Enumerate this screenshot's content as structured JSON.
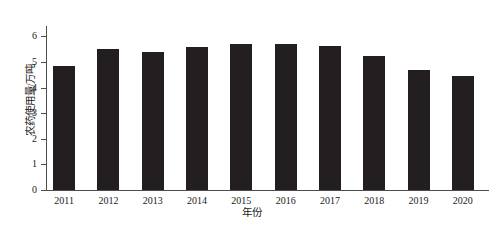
{
  "chart_data": {
    "type": "bar",
    "title": "",
    "xlabel": "年份",
    "ylabel": "农药使用量/万吨",
    "categories": [
      "2011",
      "2012",
      "2013",
      "2014",
      "2015",
      "2016",
      "2017",
      "2018",
      "2019",
      "2020"
    ],
    "values": [
      4.83,
      5.5,
      5.4,
      5.58,
      5.7,
      5.7,
      5.62,
      5.22,
      4.7,
      4.43
    ],
    "ylim": [
      0,
      6.4
    ],
    "yticks": [
      0,
      1,
      2,
      3,
      4,
      5,
      6
    ],
    "ytick_labels": [
      "0",
      "1",
      "2",
      "3",
      "4",
      "5",
      "6"
    ],
    "grid": false,
    "legend": false,
    "bar_color": "#231f20",
    "axis_color": "#4d4d4d"
  }
}
